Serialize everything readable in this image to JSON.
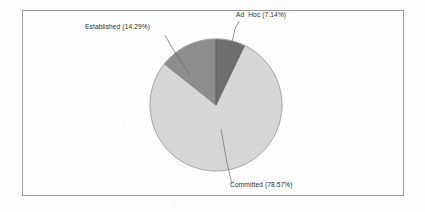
{
  "frame": {
    "border_color": "#9a9a9a",
    "background": "#fefefe"
  },
  "chart_data": {
    "type": "pie",
    "title": "",
    "subtitle": "",
    "xlabel": "",
    "ylabel": "",
    "legend_position": "none",
    "grid": false,
    "labels_show_percent": true,
    "start_angle_deg": 0,
    "direction": "clockwise",
    "categories": [
      "Ad  Hoc",
      "Committed",
      "Established"
    ],
    "values": [
      7.14,
      78.57,
      14.29
    ],
    "colors": [
      "#6e6e6e",
      "#d6d6d6",
      "#8d8d8d"
    ],
    "slices": [
      {
        "name": "Ad  Hoc",
        "value": 7.14,
        "percent_text": "7.14%",
        "label": "Ad  Hoc (7.14%)",
        "color": "#6e6e6e",
        "start_angle_deg": 0,
        "end_angle_deg": 25.7
      },
      {
        "name": "Committed",
        "value": 78.57,
        "percent_text": "78.57%",
        "label": "Committed (78.57%)",
        "color": "#d6d6d6",
        "start_angle_deg": 25.7,
        "end_angle_deg": 308.5
      },
      {
        "name": "Established",
        "value": 14.29,
        "percent_text": "14.29%",
        "label": "Established (14.29%)",
        "color": "#8d8d8d",
        "start_angle_deg": 308.5,
        "end_angle_deg": 360
      }
    ]
  },
  "labels": {
    "ad_hoc": "Ad  Hoc (7.14%)",
    "established": "Established (14.29%)",
    "committed": "Committed (78.57%)"
  },
  "geometry": {
    "center_x": 193,
    "center_y": 94,
    "radius": 66
  }
}
